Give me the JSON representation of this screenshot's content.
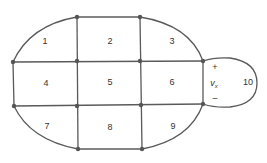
{
  "diagram": {
    "type": "planar-network-meshes",
    "meshes": [
      {
        "id": "mesh-1",
        "label": "1",
        "x": 45,
        "y": 42
      },
      {
        "id": "mesh-2",
        "label": "2",
        "x": 110,
        "y": 42
      },
      {
        "id": "mesh-3",
        "label": "3",
        "x": 172,
        "y": 42
      },
      {
        "id": "mesh-4",
        "label": "4",
        "x": 46,
        "y": 84
      },
      {
        "id": "mesh-5",
        "label": "5",
        "x": 110,
        "y": 83
      },
      {
        "id": "mesh-6",
        "label": "6",
        "x": 172,
        "y": 83
      },
      {
        "id": "mesh-7",
        "label": "7",
        "x": 47,
        "y": 127
      },
      {
        "id": "mesh-8",
        "label": "8",
        "x": 110,
        "y": 128
      },
      {
        "id": "mesh-9",
        "label": "9",
        "x": 173,
        "y": 127
      },
      {
        "id": "mesh-10",
        "label": "10",
        "x": 248,
        "y": 83
      }
    ],
    "source": {
      "plus": "+",
      "minus": "–",
      "variable": "v",
      "subscript": "x"
    }
  }
}
